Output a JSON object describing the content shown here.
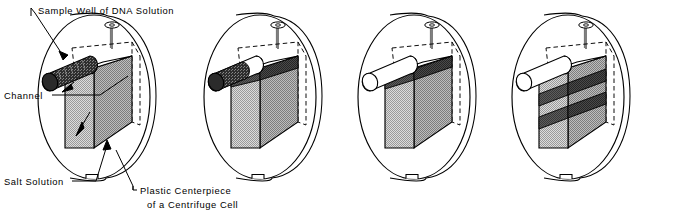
{
  "figure": {
    "type": "scientific-line-diagram",
    "panel_count": 4,
    "colors": {
      "stroke": "#000000",
      "background": "#ffffff",
      "salt_solution_front": "#c9c9c9",
      "salt_solution_side": "#a8a8a8",
      "dna_band": "#555555",
      "dna_channel_fill": "#3a3a3a",
      "empty_channel_fill": "#ffffff"
    }
  },
  "labels": [
    {
      "id": "sample-well",
      "text": "Sample Well of DNA Solution",
      "lines": [
        "Sample Well of DNA Solution"
      ],
      "x": 38,
      "y": 11,
      "anchor": "start"
    },
    {
      "id": "channel",
      "text": "Channel",
      "lines": [
        "Channel"
      ],
      "x": 4,
      "y": 98,
      "anchor": "start"
    },
    {
      "id": "salt-solution",
      "text": "Salt Solution",
      "lines": [
        "Salt Solution"
      ],
      "x": 4,
      "y": 184,
      "anchor": "start"
    },
    {
      "id": "plastic-centerpiece",
      "text": "Plastic Centerpiece of a Centrifuge Cell",
      "lines": [
        "Plastic Centerpiece",
        "of a Centrifuge Cell"
      ],
      "x": 140,
      "y": 193,
      "anchor": "start"
    }
  ],
  "label_text": {
    "sample_well": "Sample Well of DNA Solution",
    "channel": "Channel",
    "salt_solution": "Salt Solution",
    "centerpiece_line1": "Plastic Centerpiece",
    "centerpiece_line2": "of a Centrifuge Cell"
  },
  "panels": [
    {
      "index": 1,
      "name": "panel-loaded",
      "description": "Sample well channel full of DNA solution, sector chamber full of salt solution, no bands",
      "channel_state": "full-dna",
      "band_count": 0,
      "offset_x": 30
    },
    {
      "index": 2,
      "name": "panel-layering",
      "description": "DNA begins to layer over the salt solution at top of sector; channel partly emptied",
      "channel_state": "partly-full",
      "band_count": 1,
      "offset_x": 196
    },
    {
      "index": 3,
      "name": "panel-sedimenting",
      "description": "Channel empty; single DNA zone at the top of the salt column",
      "channel_state": "empty",
      "band_count": 1,
      "offset_x": 350
    },
    {
      "index": 4,
      "name": "panel-banded",
      "description": "Channel empty; two resolved DNA bands sedimented within the salt column",
      "channel_state": "empty",
      "band_count": 2,
      "offset_x": 504
    }
  ]
}
